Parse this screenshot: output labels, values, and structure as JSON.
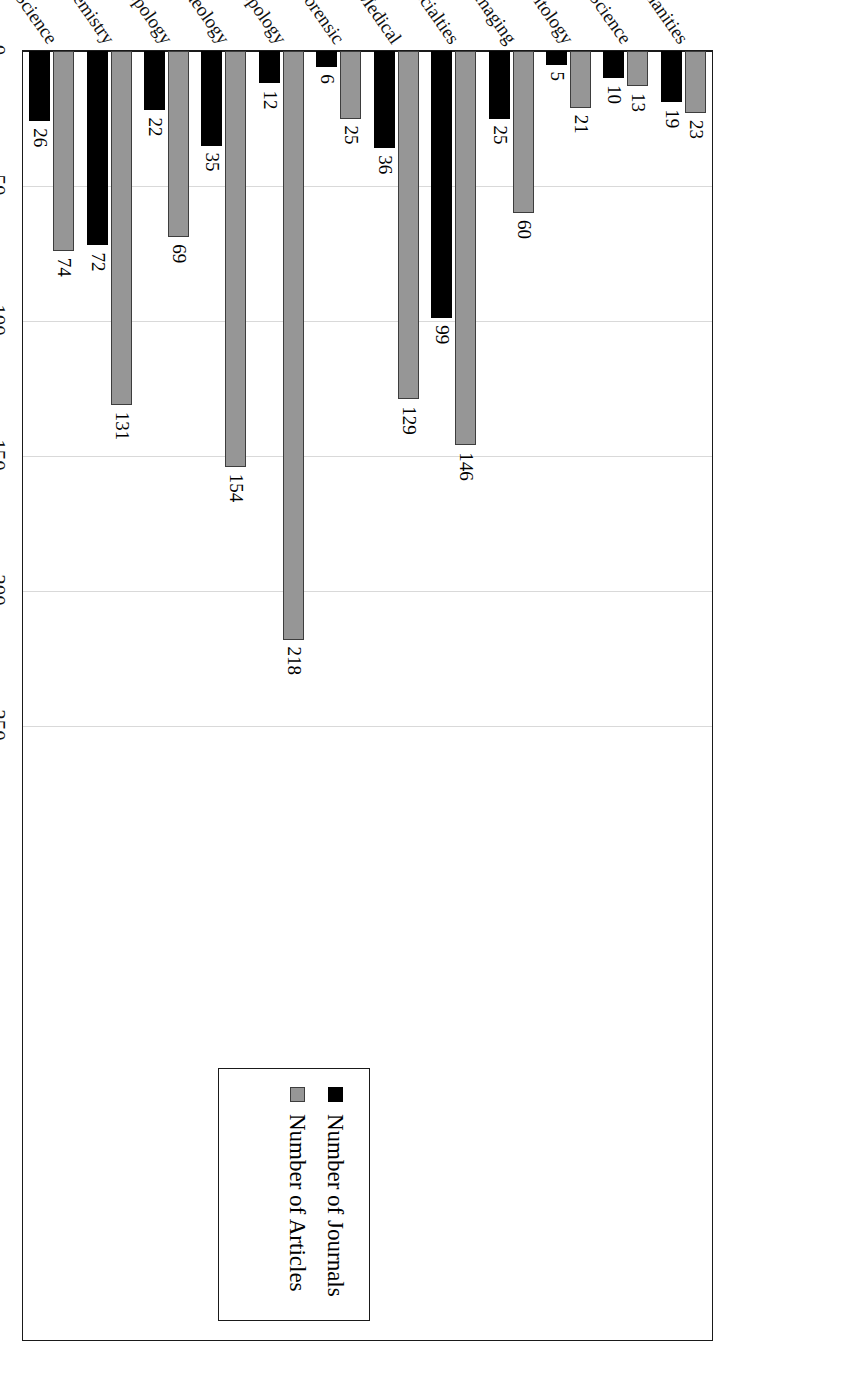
{
  "chart_data": {
    "type": "bar",
    "orientation": "horizontal",
    "title": "",
    "xlabel": "",
    "ylabel": "",
    "grid": true,
    "legend_position": "top-left",
    "xlim": [
      0,
      250
    ],
    "xticks": [
      0,
      50,
      100,
      150,
      200,
      250
    ],
    "xtick_labels": [
      "0",
      "50",
      "100",
      "150",
      "200",
      "250"
    ],
    "categories": [
      "General Science",
      "Biology/Chemistry",
      "Anthropology",
      "Archaeology",
      "Biological Anthropology",
      "Forensic",
      "General Medical",
      "Medical Specialties",
      "Radiography/Imaging",
      "Parasitology",
      "Earth Science",
      "Humanities"
    ],
    "series": [
      {
        "name": "Number of Journals",
        "color": "#000000",
        "values": [
          26,
          72,
          22,
          35,
          12,
          6,
          36,
          99,
          25,
          5,
          10,
          19
        ]
      },
      {
        "name": "Number of Articles",
        "color": "#969696",
        "values": [
          74,
          131,
          69,
          154,
          218,
          25,
          129,
          146,
          60,
          21,
          13,
          23
        ]
      }
    ]
  },
  "legend": {
    "entries": [
      {
        "label": "Number of Journals",
        "swatch": "black-square-swatch"
      },
      {
        "label": "Number of Articles",
        "swatch": "gray-square-swatch"
      }
    ]
  }
}
